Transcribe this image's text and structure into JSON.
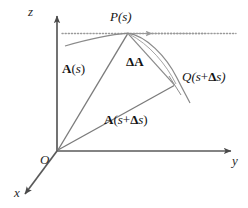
{
  "figure": {
    "background_color": "#ffffff",
    "line_color": "#6f6f6f",
    "axis_color": "#5a5a5a",
    "curve_color": "#8a8a8a",
    "dotted_color": "#9a9a9a",
    "text_color": "#141414",
    "width": 248,
    "height": 208
  },
  "axes": {
    "z": {
      "label": "z",
      "arrow": "up"
    },
    "y": {
      "label": "y",
      "arrow": "right"
    },
    "x": {
      "label": "x",
      "arrow": "down-left"
    },
    "origin": {
      "label": "O"
    }
  },
  "points": {
    "P": {
      "name": "P",
      "label_prefix": "P(",
      "label_arg": "s",
      "label_suffix": ")",
      "label_full": "P(s)",
      "x": 128,
      "y": 33
    },
    "Q": {
      "name": "Q",
      "label_prefix": "Q(",
      "label_arg": "s",
      "label_plus": "+",
      "label_delta": "Δ",
      "label_arg2": "s",
      "label_suffix": ")",
      "label_full": "Q(s+Δs)",
      "x": 175,
      "y": 85
    }
  },
  "vectors": {
    "A_s": {
      "label_bold": "A",
      "label_open": "(",
      "label_arg": "s",
      "label_close": ")",
      "label_full": "A(s)",
      "from": "O",
      "to": "P"
    },
    "delta_A": {
      "label_delta": "Δ",
      "label_bold": "A",
      "label_full": "ΔA",
      "from": "P",
      "to": "Q"
    },
    "A_s_ds": {
      "label_bold": "A",
      "label_open": "(",
      "label_arg": "s",
      "label_plus": "+",
      "label_delta": "Δ",
      "label_arg2": "s",
      "label_close": ")",
      "label_full": "A(s+Δs)",
      "from": "O",
      "to": "Q"
    }
  },
  "curve": {
    "name": "space-curve",
    "description": "arc passing through P and Q"
  },
  "tangent": {
    "name": "tangent-dotted-line",
    "style": "dotted",
    "has_arrow": true
  }
}
